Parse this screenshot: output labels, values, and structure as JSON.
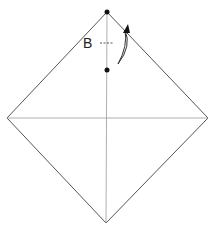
{
  "diagram": {
    "type": "origami-fold-step",
    "shape": "square rotated 45° (diamond) with center crease lines",
    "points": {
      "top": [
        107,
        12
      ],
      "left": [
        7,
        118
      ],
      "right": [
        208,
        118
      ],
      "bottom": [
        106,
        223
      ]
    },
    "markers": [
      {
        "name": "top-dot",
        "x": 107,
        "y": 12
      },
      {
        "name": "fold-target-dot",
        "x": 107,
        "y": 70
      }
    ],
    "label": {
      "text": "B",
      "x": 82,
      "y": 38
    },
    "colors": {
      "line": "#555555",
      "crease": "#999999",
      "dot": "#111111"
    }
  }
}
